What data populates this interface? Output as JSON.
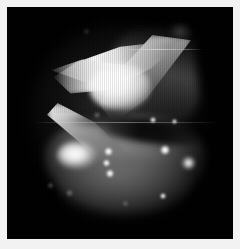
{
  "image": {
    "kind": "astronomical-observation",
    "subject_description": "Bipolar reflection nebula with X-shaped (bowtie) bright lobes, central dark dust lane, and diffuse southern fan containing bright knots",
    "color_mode": "grayscale",
    "frame": {
      "border_color": "#f2f2f2",
      "border_width_px": 7,
      "plate_background": "#000000",
      "plate_width_px": 226,
      "plate_height_px": 232
    },
    "canvas": {
      "width_px": 240,
      "height_px": 249
    }
  },
  "features": {
    "bright_core": {
      "name": "central-bright-core",
      "center_x": 110,
      "center_y": 80,
      "peak_brightness": 255
    },
    "dust_lane": {
      "name": "equatorial-dust-lane",
      "center_x": 140,
      "center_y": 122,
      "length_px": 110,
      "angle_deg": 7
    },
    "lobes": [
      {
        "name": "northeast-lobe",
        "x": 150,
        "y": 55,
        "brightness": 210
      },
      {
        "name": "northwest-spike",
        "x": 66,
        "y": 62,
        "brightness": 245
      },
      {
        "name": "southwest-lobe",
        "x": 70,
        "y": 148,
        "brightness": 255
      },
      {
        "name": "southern-fan",
        "x": 118,
        "y": 155,
        "brightness": 130
      }
    ],
    "knots": [
      {
        "name": "knot-a",
        "x": 101,
        "y": 144,
        "size": 8,
        "brightness": 255
      },
      {
        "name": "knot-b",
        "x": 100,
        "y": 156,
        "size": 6,
        "brightness": 240
      },
      {
        "name": "knot-c",
        "x": 103,
        "y": 166,
        "size": 7,
        "brightness": 250
      },
      {
        "name": "knot-d",
        "x": 158,
        "y": 143,
        "size": 9,
        "brightness": 255
      },
      {
        "name": "knot-e",
        "x": 181,
        "y": 156,
        "size": 10,
        "brightness": 235
      },
      {
        "name": "knot-f",
        "x": 156,
        "y": 189,
        "size": 5,
        "brightness": 230
      },
      {
        "name": "knot-g",
        "x": 146,
        "y": 113,
        "size": 5,
        "brightness": 255
      },
      {
        "name": "knot-h",
        "x": 167,
        "y": 114,
        "size": 4,
        "brightness": 225
      }
    ],
    "faint_points": [
      {
        "name": "faint-point-1",
        "x": 90,
        "y": 108,
        "size": 4
      },
      {
        "name": "faint-point-2",
        "x": 62,
        "y": 186,
        "size": 4
      },
      {
        "name": "faint-point-3",
        "x": 43,
        "y": 178,
        "size": 3
      },
      {
        "name": "faint-point-4",
        "x": 118,
        "y": 196,
        "size": 3
      },
      {
        "name": "faint-point-5",
        "x": 79,
        "y": 24,
        "size": 3
      }
    ],
    "fuzzy_blob": {
      "name": "faint-companion-blob",
      "x": 173,
      "y": 25,
      "width": 22,
      "height": 18
    },
    "scan_streaks": [
      {
        "name": "scan-streak-upper",
        "x": 104,
        "y": 42,
        "width": 92
      },
      {
        "name": "scan-streak-mid",
        "x": 30,
        "y": 115,
        "width": 180
      }
    ]
  },
  "palette": {
    "background": "#000000",
    "border": "#f2f2f2",
    "highlight": "#ffffff",
    "midtone": "#8a8a8a",
    "shadow": "#1a1a1a"
  }
}
